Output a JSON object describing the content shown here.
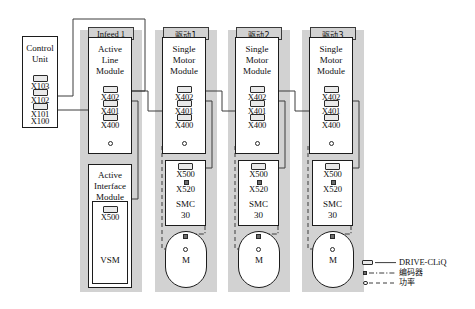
{
  "diagram": {
    "columns": [
      {
        "id": "infeed1",
        "header": "Infeed 1",
        "header_cjk": false
      },
      {
        "id": "drive1",
        "header": "驱动1",
        "header_cjk": true
      },
      {
        "id": "drive2",
        "header": "驱动2",
        "header_cjk": true
      },
      {
        "id": "drive3",
        "header": "驱动3",
        "header_cjk": true
      }
    ],
    "control_unit": {
      "name": "control-unit",
      "title_line1": "Control",
      "title_line2": "Unit",
      "ports": [
        "X103",
        "X102",
        "X101",
        "X100"
      ]
    },
    "active_line_module": {
      "title_line1": "Active",
      "title_line2": "Line",
      "title_line3": "Module",
      "ports": [
        "X402",
        "X401",
        "X400"
      ],
      "power_marker": "power-connector"
    },
    "active_interface_module": {
      "title_line1": "Active",
      "title_line2": "Interface",
      "title_line3": "Module",
      "ports": [
        "X500"
      ],
      "inner_label": "VSM"
    },
    "motor_module": {
      "title_line1": "Single",
      "title_line2": "Motor",
      "title_line3": "Module",
      "ports": [
        "X402",
        "X401",
        "X400"
      ],
      "power_marker": "power-connector"
    },
    "smc": {
      "ports": [
        "X500",
        "X520"
      ],
      "label_line1": "SMC",
      "label_line2": "30"
    },
    "motor": {
      "label": "M",
      "encoder_marker": "encoder-connector",
      "power_marker": "power-connector"
    },
    "legend": {
      "items": [
        {
          "marker": "plug",
          "label": "DRIVE-CLiQ",
          "style": "solid",
          "cjk": false
        },
        {
          "marker": "square",
          "label": "编码器",
          "style": "dash-dot",
          "cjk": true
        },
        {
          "marker": "circle",
          "label": "功率",
          "style": "dashed",
          "cjk": true
        }
      ]
    },
    "colors": {
      "column_band": "#d2d2d2",
      "box_border": "#1c1c1c",
      "box_fill": "#ffffff",
      "line": "#3c3c3c",
      "page": "#ffffff"
    }
  }
}
